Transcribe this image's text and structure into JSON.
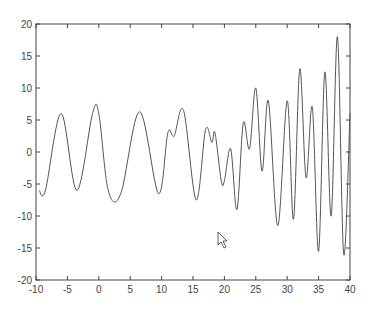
{
  "chart_data": {
    "type": "line",
    "title": "",
    "xlabel": "",
    "ylabel": "",
    "xlim": [
      -10,
      40
    ],
    "ylim": [
      -20,
      20
    ],
    "grid": false,
    "legend": null,
    "x_ticks": [
      "-10",
      "-5",
      "0",
      "5",
      "10",
      "15",
      "20",
      "25",
      "30",
      "35",
      "40"
    ],
    "y_ticks": [
      "20",
      "15",
      "10",
      "5",
      "0",
      "-5",
      "-10",
      "-15",
      "-20"
    ],
    "series": [
      {
        "name": "signal",
        "color": "#555555",
        "x": [
          -9.5,
          -8.5,
          -6,
          -3.5,
          -1,
          0,
          1.5,
          3.5,
          6.5,
          9.5,
          11,
          12,
          13.5,
          15.5,
          17,
          18,
          18.5,
          19.5,
          20,
          21,
          22,
          23,
          24,
          25,
          26,
          27,
          28.5,
          30,
          31,
          32,
          33,
          34,
          35,
          36,
          37,
          38,
          39,
          40
        ],
        "y": [
          -6,
          -6,
          6,
          -6,
          6,
          6,
          -6,
          -6.5,
          6.3,
          -6.5,
          3,
          2.5,
          6.5,
          -7.5,
          3.5,
          1.5,
          3,
          -4.5,
          -4.5,
          0.5,
          -9,
          4.5,
          0.5,
          10,
          -3,
          8,
          -11.5,
          8,
          -10.5,
          13,
          -4,
          7,
          -15.5,
          12.5,
          -10,
          18,
          -16,
          6
        ]
      }
    ]
  },
  "cursor": {
    "icon": "mouse-pointer-icon",
    "x": 218,
    "y": 232
  }
}
